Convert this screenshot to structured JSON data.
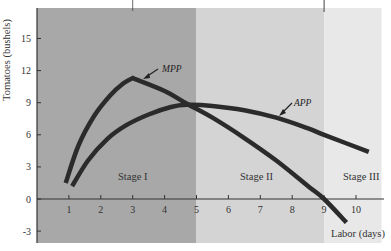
{
  "chart_data": {
    "type": "line",
    "title": "",
    "xlabel": "Labor (days)",
    "ylabel": "Tomatoes (bushels)",
    "xlim": [
      0,
      10.8
    ],
    "ylim": [
      -3.9,
      17.9
    ],
    "xticks": [
      1,
      2,
      3,
      4,
      5,
      6,
      7,
      8,
      9,
      10
    ],
    "yticks": [
      -3,
      0,
      3,
      6,
      9,
      12,
      15
    ],
    "grid": false,
    "legend": "inline labels with arrows",
    "regions": [
      {
        "name": "Stage I",
        "x_start": 0,
        "x_end": 5,
        "color": "#a8a8a8"
      },
      {
        "name": "Stage II",
        "x_start": 5,
        "x_end": 9,
        "color": "#d4d4d4"
      },
      {
        "name": "Stage III",
        "x_start": 9,
        "x_end": 10.8,
        "color": "#e8e8e8"
      }
    ],
    "series": [
      {
        "name": "MPP",
        "x": [
          0.9,
          1.3,
          1.8,
          2.3,
          2.7,
          3.0,
          4.0,
          4.7,
          5.5,
          6.5,
          7.5,
          8.5,
          9.0,
          9.7
        ],
        "y": [
          1.5,
          5.0,
          7.8,
          9.7,
          10.8,
          11.3,
          10.1,
          8.9,
          7.6,
          5.7,
          3.6,
          1.2,
          0.0,
          -2.2
        ]
      },
      {
        "name": "APP",
        "x": [
          1.1,
          1.6,
          2.2,
          2.8,
          3.5,
          4.2,
          4.7,
          5.5,
          6.5,
          7.5,
          8.5,
          9.0,
          10.4
        ],
        "y": [
          1.2,
          3.6,
          5.6,
          6.9,
          7.9,
          8.6,
          8.8,
          8.7,
          8.3,
          7.6,
          6.6,
          6.0,
          4.4
        ]
      }
    ],
    "annotations": [
      {
        "text": "MPP",
        "points_to": [
          3.1,
          11.2
        ]
      },
      {
        "text": "APP",
        "points_to": [
          7.5,
          7.7
        ]
      }
    ]
  },
  "labels": {
    "y_axis_title": "Tomatoes (bushels)",
    "x_axis_title": "Labor (days)",
    "stage_1": "Stage I",
    "stage_2": "Stage II",
    "stage_3": "Stage III",
    "mpp": "MPP",
    "app": "APP"
  }
}
